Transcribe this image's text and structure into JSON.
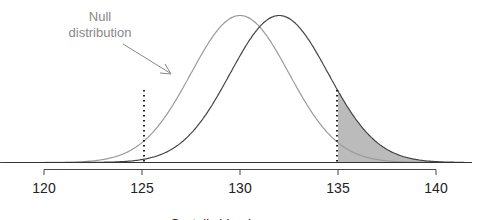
{
  "chart_data": {
    "type": "line",
    "title": "",
    "xlabel": "Systolic blood pressure",
    "ylabel": "",
    "xlim": [
      117.5,
      141.5
    ],
    "grid": false,
    "x_ticks": [
      120,
      125,
      130,
      135,
      140
    ],
    "x_tick_labels": [
      "120",
      "125",
      "130",
      "135",
      "140"
    ],
    "series": [
      {
        "name": "Null distribution",
        "mean": 130,
        "sd": 2.5,
        "color": "#999999"
      },
      {
        "name": "Alternative distribution",
        "mean": 132,
        "sd": 2.5,
        "color": "#444444"
      }
    ],
    "cutoffs": [
      125,
      135
    ],
    "shaded_region": {
      "from": 135,
      "to": 141.5,
      "under": "Alternative distribution",
      "color": "#bbbbbb"
    },
    "annotations": [
      {
        "text": "Null distribution",
        "arrow_to": "Null distribution curve"
      }
    ]
  },
  "annotation": {
    "line1": "Null",
    "line2": "distribution"
  },
  "axis": {
    "ticks": [
      "120",
      "125",
      "130",
      "135",
      "140"
    ],
    "label": "Systolic blood pressure"
  }
}
